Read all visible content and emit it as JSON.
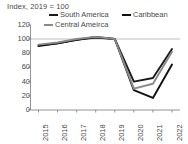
{
  "chart_data": {
    "type": "line",
    "title": "Index, 2019 = 100",
    "xlabel": "",
    "ylabel": "",
    "x": [
      "2015",
      "2016",
      "2017",
      "2018",
      "2019",
      "2020",
      "2021",
      "2022"
    ],
    "categories": [
      "2015",
      "2016",
      "2017",
      "2018",
      "2019",
      "2020",
      "2021",
      "2022"
    ],
    "yticks": [
      "120",
      "100",
      "80",
      "60",
      "40",
      "20",
      "0"
    ],
    "ylim": [
      0,
      120
    ],
    "grid": false,
    "gridline_at_100": true,
    "legend_position": "top",
    "series": [
      {
        "name": "South America",
        "color": "#1a1a1a",
        "values": [
          91,
          94,
          99,
          103,
          100,
          40,
          45,
          86
        ]
      },
      {
        "name": "Caribbean",
        "color": "#111111",
        "values": [
          90,
          94,
          99,
          102,
          100,
          28,
          17,
          64
        ]
      },
      {
        "name": "Central America",
        "color": "#8a8a8a",
        "values": [
          92,
          95,
          100,
          103,
          100,
          30,
          37,
          82
        ]
      }
    ]
  },
  "legend": {
    "south_america": "South America",
    "caribbean": "Caribbean",
    "central_america": "Central Ameirca"
  },
  "axis": {
    "y": [
      "120",
      "100",
      "80",
      "60",
      "40",
      "20",
      "0"
    ],
    "x": [
      "2015",
      "2016",
      "2017",
      "2018",
      "2019",
      "2020",
      "2021",
      "2022"
    ]
  },
  "colors": {
    "south_america": "#1a1a1a",
    "caribbean": "#111111",
    "central_america": "#8a8a8a",
    "axis": "#7a7a7a",
    "text": "#4a4a4a",
    "background": "#ffffff"
  }
}
